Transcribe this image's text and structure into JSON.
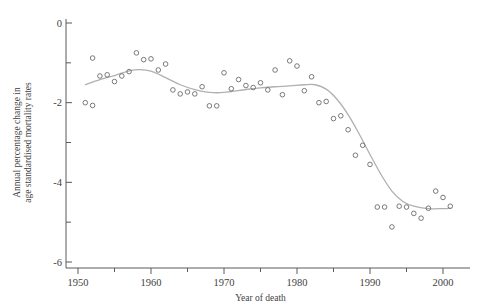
{
  "chart_data": {
    "type": "scatter",
    "title": "",
    "xlabel": "Year of death",
    "ylabel": "Annual percentage change in age standardised mortality rates",
    "ylabel_line1": "Annual percentage change in",
    "ylabel_line2": "age standardised mortality rates",
    "xlim": [
      1950,
      2002
    ],
    "ylim": [
      -6,
      0
    ],
    "xticks": [
      1950,
      1960,
      1970,
      1980,
      1990,
      2000
    ],
    "xtick_labels": [
      "1950",
      "1960",
      "1970",
      "1980",
      "1990",
      "2000"
    ],
    "xminor_ticks": [
      1955,
      1965,
      1975,
      1985,
      1995
    ],
    "yticks": [
      0,
      -2,
      -4,
      -6
    ],
    "ytick_labels": [
      "0",
      "-2",
      "-4",
      "-6"
    ],
    "yminor_ticks": [
      -1,
      -3,
      -5
    ],
    "grid": false,
    "legend": "none",
    "marker": "open-circle",
    "marker_color": "#6b6b6b",
    "line_color": "#b0b0b0",
    "series": [
      {
        "name": "Annual percentage change",
        "x": [
          1951,
          1952,
          1952,
          1953,
          1954,
          1955,
          1956,
          1957,
          1958,
          1959,
          1960,
          1961,
          1962,
          1963,
          1964,
          1965,
          1966,
          1967,
          1968,
          1969,
          1970,
          1971,
          1972,
          1973,
          1974,
          1975,
          1976,
          1977,
          1978,
          1979,
          1980,
          1981,
          1982,
          1983,
          1984,
          1985,
          1986,
          1987,
          1988,
          1989,
          1990,
          1991,
          1992,
          1993,
          1994,
          1995,
          1996,
          1997,
          1998,
          1999,
          2000,
          2001
        ],
        "y": [
          -2.0,
          -2.07,
          -0.88,
          -1.33,
          -1.3,
          -1.47,
          -1.33,
          -1.22,
          -0.75,
          -0.92,
          -0.9,
          -1.18,
          -1.03,
          -1.68,
          -1.78,
          -1.73,
          -1.78,
          -1.6,
          -2.08,
          -2.08,
          -1.25,
          -1.65,
          -1.42,
          -1.57,
          -1.62,
          -1.5,
          -1.68,
          -1.18,
          -1.8,
          -0.95,
          -1.08,
          -1.7,
          -1.35,
          -2.0,
          -1.97,
          -2.4,
          -2.33,
          -2.68,
          -3.32,
          -3.07,
          -3.55,
          -4.62,
          -4.62,
          -5.12,
          -4.6,
          -4.62,
          -4.78,
          -4.9,
          -4.65,
          -4.22,
          -4.38,
          -4.6
        ],
        "note": "52 annual observations, 1951-2001"
      }
    ],
    "fitted_curve": {
      "name": "smoothed fit",
      "x": [
        1951,
        1953,
        1955,
        1957,
        1958.5,
        1960,
        1962,
        1964,
        1966,
        1968,
        1969.5,
        1971,
        1973,
        1975,
        1977,
        1979,
        1981,
        1982.5,
        1984,
        1985.5,
        1987,
        1988.5,
        1990,
        1991.5,
        1993,
        1994.5,
        1996,
        1998,
        2000,
        2001
      ],
      "y": [
        -1.55,
        -1.42,
        -1.32,
        -1.2,
        -1.17,
        -1.21,
        -1.37,
        -1.55,
        -1.67,
        -1.74,
        -1.75,
        -1.72,
        -1.67,
        -1.63,
        -1.6,
        -1.58,
        -1.55,
        -1.55,
        -1.66,
        -1.92,
        -2.3,
        -2.78,
        -3.3,
        -3.8,
        -4.22,
        -4.48,
        -4.6,
        -4.66,
        -4.66,
        -4.65
      ]
    }
  },
  "figure": {
    "background": "#ffffff",
    "width": 477,
    "height": 306
  }
}
